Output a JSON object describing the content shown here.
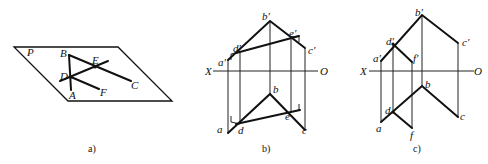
{
  "figures": [
    {
      "id": "a",
      "caption": "a)",
      "plane_label": "P",
      "points": {
        "A": "A",
        "B": "B",
        "C": "C",
        "D": "D",
        "E": "E",
        "F": "F"
      }
    },
    {
      "id": "b",
      "caption": "b)",
      "axis": {
        "left": "X",
        "right": "O"
      },
      "upper_points": {
        "a": "a'",
        "b": "b'",
        "c": "c'",
        "d": "d'",
        "e": "e'"
      },
      "lower_points": {
        "a": "a",
        "b": "b",
        "c": "c",
        "d": "d",
        "e": "e"
      }
    },
    {
      "id": "c",
      "caption": "c)",
      "axis": {
        "left": "X",
        "right": "O"
      },
      "upper_points": {
        "a": "a'",
        "b": "b'",
        "c": "c'",
        "d": "d'",
        "f": "f'"
      },
      "lower_points": {
        "a": "a",
        "b": "b",
        "c": "c",
        "d": "d",
        "f": "f"
      }
    }
  ]
}
